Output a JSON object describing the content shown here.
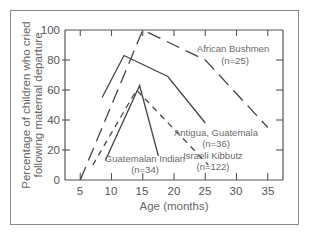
{
  "chart_data": {
    "type": "line",
    "title": "",
    "xlabel": "Age (months)",
    "ylabel_lines": [
      "Percentage of children who cried",
      "following maternal departure"
    ],
    "ylabel": "Percentage of children who cried following maternal departure",
    "xlim": [
      3,
      37
    ],
    "ylim": [
      0,
      100
    ],
    "x_ticks": [
      5,
      10,
      15,
      20,
      25,
      30,
      35
    ],
    "y_ticks": [
      0,
      20,
      40,
      60,
      80,
      100
    ],
    "grid": false,
    "legend": "inline labels",
    "series": [
      {
        "name": "African Bushmen",
        "n_label": "(n=25)",
        "style": "long-dash",
        "points": [
          [
            5,
            0
          ],
          [
            15,
            100
          ],
          [
            25,
            80
          ],
          [
            35,
            35
          ]
        ]
      },
      {
        "name": "Antigua, Guatemala",
        "n_label": "(n=36)",
        "style": "solid",
        "points": [
          [
            8.5,
            55
          ],
          [
            12,
            83
          ],
          [
            19,
            69
          ],
          [
            25,
            38
          ]
        ]
      },
      {
        "name": "Guatemalan Indian",
        "n_label": "(n=34)",
        "style": "solid",
        "points": [
          [
            9,
            13
          ],
          [
            14.5,
            63
          ],
          [
            17.5,
            16
          ]
        ]
      },
      {
        "name": "Israeli Kibbutz",
        "n_label": "(n=122)",
        "style": "short-dash",
        "points": [
          [
            7,
            10
          ],
          [
            14,
            60
          ],
          [
            25.5,
            10
          ]
        ]
      }
    ]
  },
  "labels": {
    "x_ticks": [
      "5",
      "10",
      "15",
      "20",
      "25",
      "30",
      "35"
    ],
    "y_ticks": [
      "0",
      "20",
      "40",
      "60",
      "80",
      "100"
    ],
    "xlabel": "Age (months)",
    "ylabel_line1": "Percentage of children who cried",
    "ylabel_line2": "following maternal departure",
    "bushmen_name": "African Bushmen",
    "bushmen_n": "(n=25)",
    "antigua_name": "Antigua, Guatemala",
    "antigua_n": "(n=36)",
    "guatemalan_name": "Guatemalan Indian",
    "guatemalan_n": "(n=34)",
    "kibbutz_name": "Israeli Kibbutz",
    "kibbutz_n": "(n=122)"
  },
  "colors": {
    "axis": "#555555",
    "line": "#444444",
    "text": "#666666",
    "frame": "#8a8a8a"
  }
}
